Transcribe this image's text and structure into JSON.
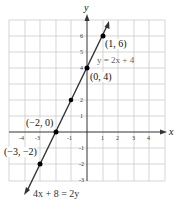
{
  "diagram": {
    "type": "coordinate-graph",
    "axes": {
      "x_label": "x",
      "y_label": "y"
    },
    "x_ticks": [
      "-4",
      "-3",
      "-1",
      "1",
      "2",
      "3",
      "4"
    ],
    "y_ticks": [
      "6",
      "5",
      "4",
      "2",
      "1",
      "-1",
      "-2",
      "-3"
    ],
    "points": [
      {
        "label": "(1, 6)",
        "x": 1,
        "y": 6
      },
      {
        "label": "(0, 4)",
        "x": 0,
        "y": 4
      },
      {
        "label": "(−2, 0)",
        "x": -2,
        "y": 0
      },
      {
        "label": "(−3, −2)",
        "x": -3,
        "y": -2
      }
    ],
    "equations": {
      "slope_intercept": "y = 2x + 4",
      "standard": "4x + 8 = 2y"
    },
    "colors": {
      "line": "#333333",
      "grid": "#bbbbbb",
      "point": "#000000",
      "equation_gray": "#777777"
    }
  }
}
